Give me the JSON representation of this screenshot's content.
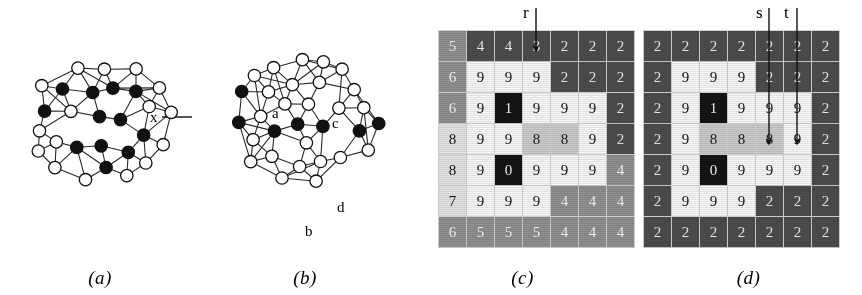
{
  "figure": {
    "panels": [
      {
        "id": "a",
        "caption": "(a)"
      },
      {
        "id": "b",
        "caption": "(b)"
      },
      {
        "id": "c",
        "caption": "(c)"
      },
      {
        "id": "d",
        "caption": "(d)"
      }
    ]
  },
  "panel_a": {
    "caption": "(a)",
    "type": "graph",
    "node_labels": [
      {
        "label": "x",
        "x": 150,
        "y": 122
      },
      {
        "label": "y",
        "x": 200,
        "y": 122
      }
    ],
    "black_node_count": 36,
    "white_node_count": 39
  },
  "panel_b": {
    "caption": "(b)",
    "type": "graph",
    "node_labels": [
      {
        "label": "a",
        "x": 72,
        "y": 118
      },
      {
        "label": "c",
        "x": 132,
        "y": 128
      },
      {
        "label": "b",
        "x": 105,
        "y": 236
      },
      {
        "label": "d",
        "x": 137,
        "y": 212
      }
    ],
    "black_node_count": 13,
    "white_node_count": 58
  },
  "chart_data": [
    {
      "type": "heatmap",
      "panel": "c",
      "title": "(c)",
      "rows": 7,
      "cols": 7,
      "values": [
        [
          5,
          4,
          4,
          3,
          2,
          2,
          2
        ],
        [
          6,
          9,
          9,
          9,
          2,
          2,
          2
        ],
        [
          6,
          9,
          1,
          9,
          9,
          9,
          2
        ],
        [
          8,
          9,
          9,
          8,
          8,
          9,
          2
        ],
        [
          8,
          9,
          0,
          9,
          9,
          9,
          4
        ],
        [
          7,
          9,
          9,
          9,
          4,
          4,
          4
        ],
        [
          6,
          5,
          5,
          5,
          4,
          4,
          4
        ]
      ],
      "shades": [
        [
          "mid",
          "dark",
          "dark",
          "dark",
          "dark",
          "dark",
          "dark"
        ],
        [
          "mid",
          "white",
          "white",
          "white",
          "dark",
          "dark",
          "dark"
        ],
        [
          "mid",
          "white",
          "black",
          "white",
          "white",
          "white",
          "dark"
        ],
        [
          "light",
          "white",
          "white",
          "lightmid",
          "lightmid",
          "white",
          "dark"
        ],
        [
          "light",
          "white",
          "black",
          "white",
          "white",
          "white",
          "mid"
        ],
        [
          "light",
          "white",
          "white",
          "white",
          "mid",
          "mid",
          "mid"
        ],
        [
          "mid",
          "mid",
          "mid",
          "mid",
          "mid",
          "mid",
          "mid"
        ]
      ],
      "annotations": [
        {
          "label": "r",
          "target_col": 4,
          "target_row": 1,
          "arrow": "down"
        }
      ]
    },
    {
      "type": "heatmap",
      "panel": "d",
      "title": "(d)",
      "rows": 7,
      "cols": 7,
      "values": [
        [
          2,
          2,
          2,
          2,
          2,
          2,
          2
        ],
        [
          2,
          9,
          9,
          9,
          2,
          2,
          2
        ],
        [
          2,
          9,
          1,
          9,
          9,
          9,
          2
        ],
        [
          2,
          9,
          8,
          8,
          8,
          9,
          2
        ],
        [
          2,
          9,
          0,
          9,
          9,
          9,
          2
        ],
        [
          2,
          9,
          9,
          9,
          2,
          2,
          2
        ],
        [
          2,
          2,
          2,
          2,
          2,
          2,
          2
        ]
      ],
      "shades": [
        [
          "dark",
          "dark",
          "dark",
          "dark",
          "dark",
          "dark",
          "dark"
        ],
        [
          "dark",
          "white",
          "white",
          "white",
          "dark",
          "dark",
          "dark"
        ],
        [
          "dark",
          "white",
          "black",
          "white",
          "white",
          "white",
          "dark"
        ],
        [
          "dark",
          "white",
          "lightmid",
          "lightmid",
          "lightmid",
          "white",
          "dark"
        ],
        [
          "dark",
          "white",
          "black",
          "white",
          "white",
          "white",
          "dark"
        ],
        [
          "dark",
          "white",
          "white",
          "white",
          "dark",
          "dark",
          "dark"
        ],
        [
          "dark",
          "dark",
          "dark",
          "dark",
          "dark",
          "dark",
          "dark"
        ]
      ],
      "annotations": [
        {
          "label": "s",
          "target_col": 5,
          "target_row": 4,
          "arrow": "down"
        },
        {
          "label": "t",
          "target_col": 6,
          "target_row": 4,
          "arrow": "down"
        }
      ]
    }
  ],
  "colors": {
    "black_cell": "#141414",
    "dark_cell": "#4c4c4c",
    "mid_cell": "#8e8e8e",
    "lightmid_cell": "#c9c9c9",
    "light_cell": "#e2e2e2",
    "white_cell": "#f6f6f6",
    "node_fill_black": "#111111",
    "node_fill_white": "#ffffff",
    "edge": "#2a2a2a",
    "background": "#ffffff"
  }
}
